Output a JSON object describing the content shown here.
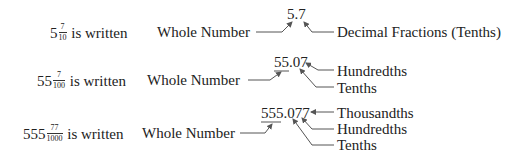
{
  "rows": [
    {
      "whole": "5",
      "numerator": "7",
      "denominator": "10",
      "is_written": "is written",
      "whole_label": "Whole Number",
      "decimal": "5.7",
      "labels": [
        "Decimal Fractions (Tenths)"
      ]
    },
    {
      "whole": "55",
      "numerator": "7",
      "denominator": "100",
      "is_written": "is written",
      "whole_label": "Whole Number",
      "decimal": "55.07",
      "labels": [
        "Hundredths",
        "Tenths"
      ]
    },
    {
      "whole": "555",
      "numerator": "77",
      "denominator": "1000",
      "is_written": "is written",
      "whole_label": "Whole Number",
      "decimal": "555.077",
      "labels": [
        "Thousandths",
        "Hundredths",
        "Tenths"
      ]
    }
  ],
  "colors": {
    "text": "#222222",
    "arrows": "#555555"
  }
}
